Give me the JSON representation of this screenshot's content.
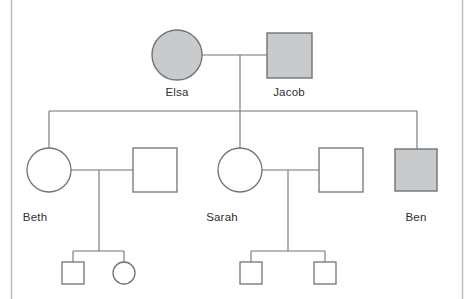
{
  "figure": {
    "width": 475,
    "height": 299,
    "background_color": "#ffffff",
    "frame_color": "#b9babc",
    "line_color": "#6e7479",
    "affected_fill_color": "#c8cacb",
    "unaffected_fill_color": "#ffffff",
    "label_color": "#2d2f31"
  },
  "legend_semantics": {
    "circle": "female",
    "square": "male",
    "shaded": "affected",
    "unshaded": "unaffected"
  },
  "generations": [
    {
      "id": "generation-1",
      "individuals": [
        {
          "id": "elsa",
          "name": "Elsa",
          "sex": "female",
          "shape": "circle",
          "affected": true,
          "cx": 177,
          "cy": 55,
          "r": 25,
          "label_x": 177,
          "label_y": 96
        },
        {
          "id": "jacob",
          "name": "Jacob",
          "sex": "male",
          "shape": "square",
          "affected": true,
          "x": 267,
          "y": 33,
          "size": 45,
          "label_x": 289,
          "label_y": 96
        }
      ]
    },
    {
      "id": "generation-2",
      "individuals": [
        {
          "id": "beth",
          "name": "Beth",
          "sex": "female",
          "shape": "circle",
          "affected": false,
          "cx": 49,
          "cy": 170,
          "r": 22,
          "label_x": 35,
          "label_y": 221
        },
        {
          "id": "beth-spouse",
          "name": "",
          "sex": "male",
          "shape": "square",
          "affected": false,
          "x": 133,
          "y": 148,
          "size": 44,
          "label_x": 0,
          "label_y": 0
        },
        {
          "id": "sarah",
          "name": "Sarah",
          "sex": "female",
          "shape": "circle",
          "affected": false,
          "cx": 240,
          "cy": 170,
          "r": 22,
          "label_x": 222,
          "label_y": 221
        },
        {
          "id": "sarah-spouse",
          "name": "",
          "sex": "male",
          "shape": "square",
          "affected": false,
          "x": 319,
          "y": 148,
          "size": 44,
          "label_x": 0,
          "label_y": 0
        },
        {
          "id": "ben",
          "name": "Ben",
          "sex": "male",
          "shape": "square",
          "affected": true,
          "x": 395,
          "y": 149,
          "size": 42,
          "label_x": 416,
          "label_y": 221
        }
      ]
    },
    {
      "id": "generation-3",
      "individuals": [
        {
          "id": "beth-child-1",
          "name": "",
          "sex": "male",
          "shape": "square",
          "affected": false,
          "x": 62,
          "y": 262,
          "size": 22,
          "label_x": 0,
          "label_y": 0
        },
        {
          "id": "beth-child-2",
          "name": "",
          "sex": "female",
          "shape": "circle",
          "affected": false,
          "cx": 124,
          "cy": 273,
          "r": 11,
          "label_x": 0,
          "label_y": 0
        },
        {
          "id": "sarah-child-1",
          "name": "",
          "sex": "male",
          "shape": "square",
          "affected": false,
          "x": 240,
          "y": 262,
          "size": 22,
          "label_x": 0,
          "label_y": 0
        },
        {
          "id": "sarah-child-2",
          "name": "",
          "sex": "male",
          "shape": "square",
          "affected": false,
          "x": 314,
          "y": 262,
          "size": 22,
          "label_x": 0,
          "label_y": 0
        }
      ]
    }
  ],
  "connections": {
    "frame_left": "M 11.5 0 L 11.5 299",
    "frame_right": "M 462.5 0 L 462.5 299",
    "couple_1_marriage": "M 202 55 L 267 55",
    "couple_1_descent": "M 240 55 L 240 111",
    "sibship_bar_gen2": "M 49 111 L 417 111",
    "sibship_drop_beth": "M 49 111 L 49 148",
    "sibship_drop_sarah": "M 240 111 L 240 148",
    "sibship_drop_ben": "M 417 111 L 417 149",
    "couple_2_marriage": "M 71 170 L 133 170",
    "couple_2_descent": "M 99 170 L 99 251",
    "sibship_bar_beth_children": "M 73 251 L 124 251",
    "sibship_drop_beth_child_1": "M 73 251 L 73 262",
    "sibship_drop_beth_child_2": "M 124 251 L 124 262",
    "couple_3_marriage": "M 262 170 L 319 170",
    "couple_3_descent": "M 288 170 L 288 251",
    "sibship_bar_sarah_children": "M 251 251 L 325 251",
    "sibship_drop_sarah_child_1": "M 251 251 L 251 262",
    "sibship_drop_sarah_child_2": "M 325 251 L 325 262"
  }
}
